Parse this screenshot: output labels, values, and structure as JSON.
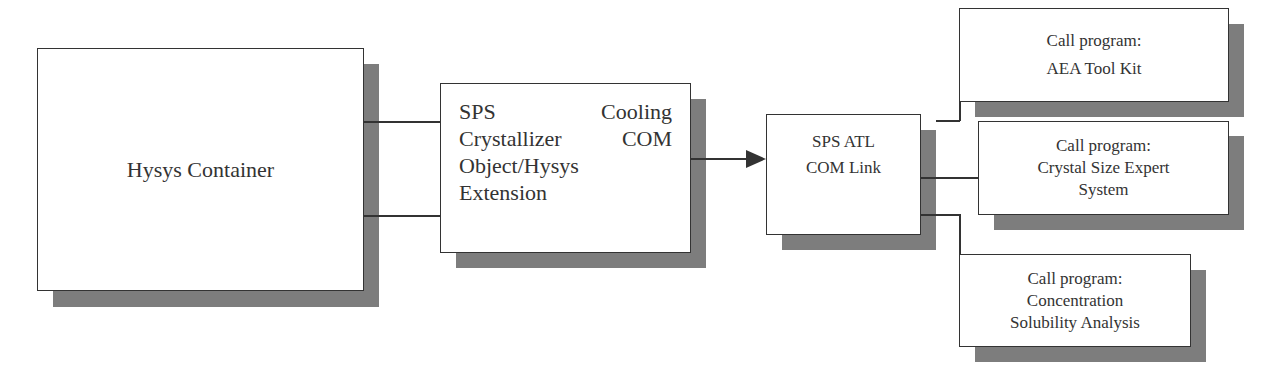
{
  "diagram": {
    "hysys_container": {
      "label": "Hysys Container"
    },
    "sps_object": {
      "lines": [
        [
          "SPS",
          "Cooling"
        ],
        [
          "Crystallizer",
          "COM"
        ],
        [
          "Object/Hysys"
        ],
        [
          "Extension"
        ]
      ]
    },
    "atl_link": {
      "line1": "SPS ATL",
      "line2": "COM Link"
    },
    "programs": [
      {
        "line1": "Call program:",
        "line2": "AEA Tool Kit"
      },
      {
        "line1": "Call program:",
        "line2": "Crystal Size Expert",
        "line3": "System"
      },
      {
        "line1": "Call program:",
        "line2": "Concentration",
        "line3": "Solubility Analysis"
      }
    ],
    "colors": {
      "border": "#333333",
      "shadow": "#7d7d7d",
      "background": "#ffffff"
    }
  }
}
